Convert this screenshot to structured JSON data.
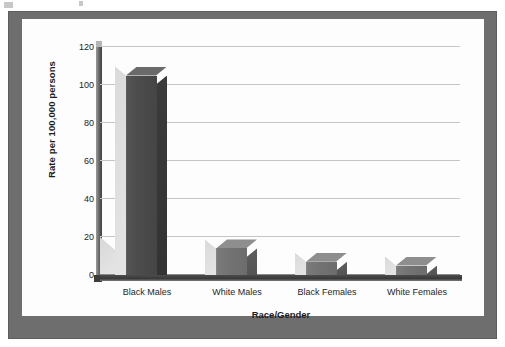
{
  "frame": {
    "border_color": "#6e6e6e",
    "page_color": "#fdfdfd"
  },
  "scan_artifact": {
    "description": "faint cut-off marks along the very top edge of the scan"
  },
  "chart_data": {
    "type": "bar",
    "title": "",
    "subtitle": "",
    "xlabel": "Race/Gender",
    "ylabel": "Rate per 100,000 persons",
    "categories": [
      "Black Males",
      "White Males",
      "Black Females",
      "White Females"
    ],
    "values": [
      105,
      14,
      7,
      5
    ],
    "ylim": [
      0,
      120
    ],
    "ytick_labels": [
      "0",
      "20",
      "40",
      "60",
      "80",
      "100",
      "120"
    ],
    "ytick_values": [
      0,
      20,
      40,
      60,
      80,
      100,
      120
    ],
    "grid": true,
    "legend": false,
    "legend_position": "none",
    "style": "3d-column",
    "bar_colors": [
      "#4c4c4c",
      "#6c6c6c",
      "#6c6c6c",
      "#6c6c6c"
    ],
    "gridline_color": "#c6c6c6",
    "axis_color": "#3e3e3e"
  }
}
